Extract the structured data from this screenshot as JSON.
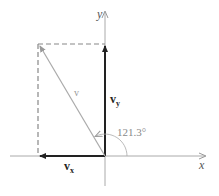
{
  "diagram": {
    "axes": {
      "x_label": "x",
      "y_label": "y"
    },
    "vectors": {
      "v": {
        "label": "v",
        "color": "#aaaaaa"
      },
      "vx": {
        "label": "v",
        "subscript": "x",
        "color": "#222222"
      },
      "vy": {
        "label": "v",
        "subscript": "y",
        "color": "#222222"
      }
    },
    "angle": {
      "label": "121.3°",
      "color": "#888888"
    },
    "dashed_color": "#888888"
  }
}
